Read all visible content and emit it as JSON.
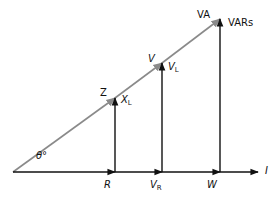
{
  "diagram": {
    "type": "phasor-triangles",
    "colors": {
      "hypotenuse": "#8a8a8a",
      "vectors": "#111111",
      "background": "#ffffff"
    },
    "angle_label": "θ°",
    "hypotenuse_labels": {
      "impedance": "Z",
      "voltage": "V",
      "apparent_power": "VA"
    },
    "vertical_labels": {
      "reactance": {
        "main": "X",
        "sub": "L"
      },
      "reactive_voltage": {
        "main": "V",
        "sub": "L"
      },
      "reactive_power": "VARs"
    },
    "horizontal_labels": {
      "resistance": "R",
      "resistive_voltage": {
        "main": "V",
        "sub": "R"
      },
      "real_power": "W",
      "current": "I"
    }
  }
}
